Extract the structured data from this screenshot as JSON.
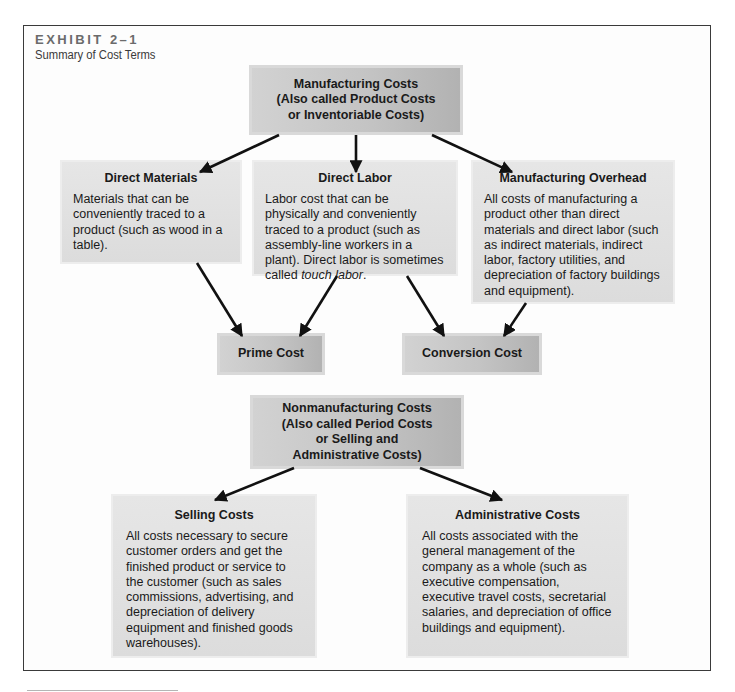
{
  "exhibit": {
    "label": "EXHIBIT 2–1",
    "subtitle": "Summary of Cost Terms"
  },
  "manufacturing_costs": {
    "line1": "Manufacturing Costs",
    "line2": "(Also called Product Costs",
    "line3": "or Inventoriable Costs)"
  },
  "direct_materials": {
    "title": "Direct Materials",
    "body": "Materials that can be conveniently traced to a product (such as wood in a table)."
  },
  "direct_labor": {
    "title": "Direct Labor",
    "body": "Labor cost that can be physically and conveniently traced to a product (such as assembly-line workers in a plant). Direct labor is sometimes called ",
    "body_italic": "touch labor",
    "body_end": "."
  },
  "manufacturing_overhead": {
    "title": "Manufacturing Overhead",
    "body": "All costs of manufacturing a product other than direct materials and direct labor (such as indirect materials, indirect labor, factory utilities, and depreciation of factory buildings and equipment)."
  },
  "prime_cost": {
    "title": "Prime Cost"
  },
  "conversion_cost": {
    "title": "Conversion Cost"
  },
  "nonmanufacturing_costs": {
    "line1": "Nonmanufacturing Costs",
    "line2": "(Also called Period Costs",
    "line3": "or Selling and",
    "line4": "Administrative Costs)"
  },
  "selling_costs": {
    "title": "Selling Costs",
    "body": "All costs necessary to secure customer orders and get the finished product or service to the customer (such as sales commissions, advertising, and depreciation of delivery equipment and finished goods warehouses)."
  },
  "administrative_costs": {
    "title": "Administrative Costs",
    "body": "All costs associated with the general management of the company as a whole (such as executive compensation, executive travel costs, secretarial salaries, and depreciation of office buildings and equipment)."
  },
  "colors": {
    "frame_border": "#3a3a3a",
    "light_box": "#e2e2e2",
    "dark_box": "#c4c4c4",
    "arrow": "#111111"
  }
}
